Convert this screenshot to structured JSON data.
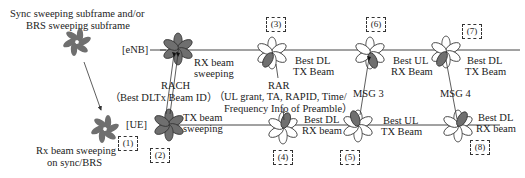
{
  "colors": {
    "petal_dark": "#6f6f6f",
    "petal_light": "#ffffff",
    "petal_stroke": "#333333",
    "line": "#444444"
  },
  "legend": {
    "sync_caption_line1": "Sync sweeping subframe and/or",
    "sync_caption_line2": "BRS sweeping subframe",
    "rx_caption_line1": "Rx beam sweeping",
    "rx_caption_line2": "on sync/BRS"
  },
  "nodes": {
    "enb_label": "[eNB]",
    "ue_label": "[UE]"
  },
  "steps": [
    {
      "id": "(1)"
    },
    {
      "id": "(2)"
    },
    {
      "id": "(3)"
    },
    {
      "id": "(4)"
    },
    {
      "id": "(5)"
    },
    {
      "id": "(6)"
    },
    {
      "id": "(7)"
    },
    {
      "id": "(8)"
    }
  ],
  "enb_labels": {
    "rx_beam_sweeping_1": "RX beam",
    "rx_beam_sweeping_2": "sweeping",
    "best_dl_tx_beam_1_a": "Best DL",
    "best_dl_tx_beam_1_b": "TX Beam",
    "best_ul_rx_beam_a": "Best UL",
    "best_ul_rx_beam_b": "RX Beam",
    "best_dl_tx_beam_2_a": "Best DL",
    "best_dl_tx_beam_2_b": "TX Beam"
  },
  "ue_labels": {
    "tx_beam_sweeping_1": "TX beam",
    "tx_beam_sweeping_2": "sweeping",
    "best_dl_rx_beam_1_a": "Best DL",
    "best_dl_rx_beam_1_b": "RX beam",
    "best_ul_tx_beam_a": "Best UL",
    "best_ul_tx_beam_b": "TX Beam",
    "best_dl_rx_beam_2_a": "Best DL",
    "best_dl_rx_beam_2_b": "RX beam"
  },
  "messages": {
    "rach": "RACH",
    "rach_detail": "（Best DLTx Beam ID）",
    "rar": "RAR",
    "rar_detail_1": "（UL grant, TA, RAPID, Time/",
    "rar_detail_2": "Frequency Info of Preamble）",
    "msg3": "MSG 3",
    "msg4": "MSG 4"
  }
}
